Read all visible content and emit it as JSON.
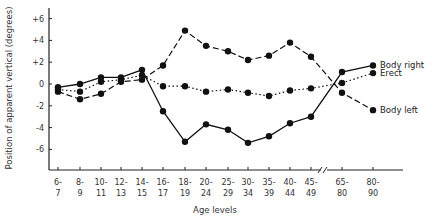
{
  "chart_data": {
    "type": "line",
    "title": "",
    "xlabel": "Age levels",
    "ylabel": "Position of apparent vertical (degrees)",
    "ylim": [
      -7,
      7
    ],
    "yticks": [
      "+6",
      "+4",
      "+2",
      "0",
      "-2",
      "-4",
      "-6"
    ],
    "ytick_values": [
      6,
      4,
      2,
      0,
      -2,
      -4,
      -6
    ],
    "grid": false,
    "legend_position": "inline-right",
    "axis_break": "between 45-49 and 65-80",
    "categories": [
      "6-7",
      "8-9",
      "10-11",
      "12-13",
      "14-15",
      "16-17",
      "18-19",
      "20-24",
      "25-29",
      "30-34",
      "35-39",
      "40-44",
      "45-49",
      "65-80",
      "80-90"
    ],
    "category_top": [
      "6-",
      "8-",
      "10-",
      "12-",
      "14-",
      "16-",
      "18-",
      "20-",
      "25-",
      "30-",
      "35-",
      "40-",
      "45-",
      "65-",
      "80-"
    ],
    "category_bottom": [
      "7",
      "9",
      "11",
      "13",
      "15",
      "17",
      "19",
      "24",
      "29",
      "34",
      "39",
      "44",
      "49",
      "80",
      "90"
    ],
    "series": [
      {
        "name": "Body right",
        "style": "solid",
        "values": [
          -0.3,
          0.0,
          0.6,
          0.6,
          1.3,
          -2.5,
          -5.3,
          -3.7,
          -4.2,
          -5.4,
          -4.8,
          -3.6,
          -3.0,
          1.1,
          1.7
        ]
      },
      {
        "name": "Erect",
        "style": "dotted",
        "values": [
          -0.5,
          -0.7,
          0.2,
          0.4,
          0.8,
          -0.2,
          -0.2,
          -0.7,
          -0.5,
          -0.8,
          -1.1,
          -0.6,
          -0.4,
          0.1,
          1.0
        ]
      },
      {
        "name": "Body left",
        "style": "dashed",
        "values": [
          -0.7,
          -1.4,
          -0.9,
          0.2,
          0.4,
          1.7,
          4.9,
          3.5,
          3.0,
          2.2,
          2.6,
          3.8,
          2.5,
          -0.8,
          -2.4
        ]
      }
    ]
  },
  "colors": {
    "line": "#111111",
    "axis": "#222222",
    "text": "#333333",
    "background": "#ffffff"
  }
}
